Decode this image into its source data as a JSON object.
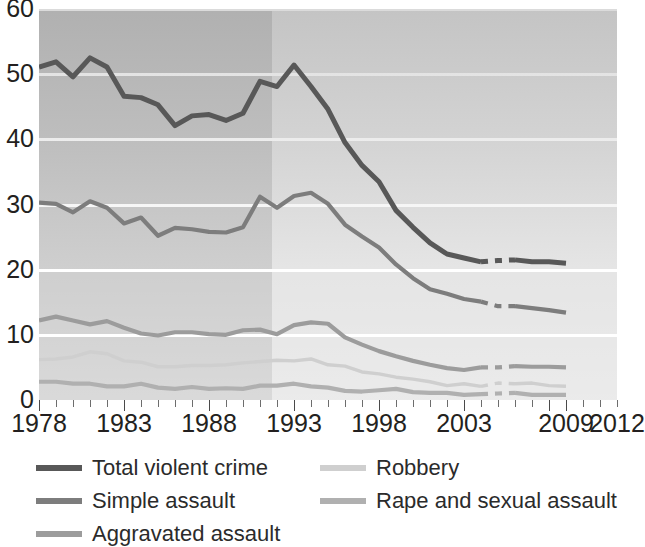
{
  "chart_data": {
    "type": "line",
    "title": "",
    "subtitle": "",
    "xlabel": "",
    "ylabel": "",
    "xlim": [
      1978,
      2012
    ],
    "ylim": [
      0,
      60
    ],
    "yticks": [
      0,
      10,
      20,
      30,
      40,
      50,
      60
    ],
    "xticks_labeled": [
      1978,
      1983,
      1988,
      1993,
      1998,
      2003,
      2009,
      2012
    ],
    "xticks_all": [
      1978,
      1979,
      1980,
      1981,
      1982,
      1983,
      1984,
      1985,
      1986,
      1987,
      1988,
      1989,
      1990,
      1991,
      1992,
      1993,
      1994,
      1995,
      1996,
      1997,
      1998,
      1999,
      2000,
      2001,
      2002,
      2003,
      2004,
      2005,
      2006,
      2007,
      2008,
      2009,
      2010,
      2011,
      2012
    ],
    "grid": "horizontal-white",
    "legend_position": "below-left",
    "shading_note": "Plot background is darker for 1978-1992 and lighter from 1993 onward; a dashed gap in every series spans 2005-2006.",
    "dashed_gap": [
      2005,
      2006
    ],
    "x": [
      1978,
      1979,
      1980,
      1981,
      1982,
      1983,
      1984,
      1985,
      1986,
      1987,
      1988,
      1989,
      1990,
      1991,
      1992,
      1993,
      1994,
      1995,
      1996,
      1997,
      1998,
      1999,
      2000,
      2001,
      2002,
      2003,
      2004,
      2005,
      2006,
      2007,
      2008,
      2009
    ],
    "series": [
      {
        "name": "Total violent crime",
        "color": "#585858",
        "values": [
          51.1,
          51.9,
          49.6,
          52.5,
          51.1,
          46.6,
          46.4,
          45.3,
          42.1,
          43.6,
          43.8,
          42.9,
          44.0,
          48.9,
          48.1,
          51.4,
          48.1,
          44.6,
          39.5,
          36.0,
          33.5,
          29.1,
          26.5,
          24.1,
          22.4,
          21.8,
          21.2,
          21.4,
          21.5,
          21.2,
          21.2,
          21.0
        ]
      },
      {
        "name": "Simple assault",
        "color": "#7d7d7d",
        "values": [
          30.3,
          30.1,
          28.8,
          30.5,
          29.5,
          27.1,
          28.0,
          25.2,
          26.4,
          26.2,
          25.8,
          25.7,
          26.5,
          31.2,
          29.5,
          31.3,
          31.8,
          30.1,
          26.9,
          25.1,
          23.4,
          20.8,
          18.7,
          17.0,
          16.3,
          15.5,
          15.1,
          14.4,
          14.4,
          14.1,
          13.8,
          13.4
        ]
      },
      {
        "name": "Aggravated assault",
        "color": "#9c9c9c",
        "values": [
          12.2,
          12.8,
          12.2,
          11.6,
          12.1,
          11.1,
          10.2,
          9.9,
          10.4,
          10.4,
          10.1,
          10.0,
          10.7,
          10.8,
          10.1,
          11.5,
          11.9,
          11.7,
          9.6,
          8.5,
          7.5,
          6.7,
          6.0,
          5.4,
          4.9,
          4.6,
          5.0,
          5.0,
          5.2,
          5.1,
          5.1,
          5.0
        ]
      },
      {
        "name": "Robbery",
        "color": "#cfcfcf",
        "values": [
          6.2,
          6.3,
          6.6,
          7.4,
          7.1,
          6.0,
          5.8,
          5.1,
          5.1,
          5.3,
          5.3,
          5.4,
          5.7,
          5.9,
          6.1,
          6.0,
          6.3,
          5.4,
          5.2,
          4.3,
          4.0,
          3.5,
          3.2,
          2.8,
          2.2,
          2.5,
          2.1,
          2.6,
          2.5,
          2.6,
          2.2,
          2.1
        ]
      },
      {
        "name": "Rape and sexual assault",
        "color": "#b0b0b0",
        "values": [
          2.8,
          2.8,
          2.5,
          2.5,
          2.1,
          2.1,
          2.5,
          1.9,
          1.7,
          2.0,
          1.7,
          1.8,
          1.7,
          2.2,
          2.2,
          2.5,
          2.1,
          1.9,
          1.4,
          1.3,
          1.5,
          1.7,
          1.2,
          1.1,
          1.1,
          0.8,
          0.9,
          1.0,
          1.1,
          0.8,
          0.8,
          0.8
        ]
      }
    ],
    "legend_columns": [
      [
        "Total violent crime",
        "Simple assault",
        "Aggravated assault"
      ],
      [
        "Robbery",
        "Rape and sexual assault"
      ]
    ]
  },
  "colors": {
    "plot_bg_dark": "#c9c9c9",
    "plot_bg_light": "#e2e2e2",
    "grid": "#ffffff",
    "text": "#231f20",
    "axis": "#6d6d6d"
  }
}
